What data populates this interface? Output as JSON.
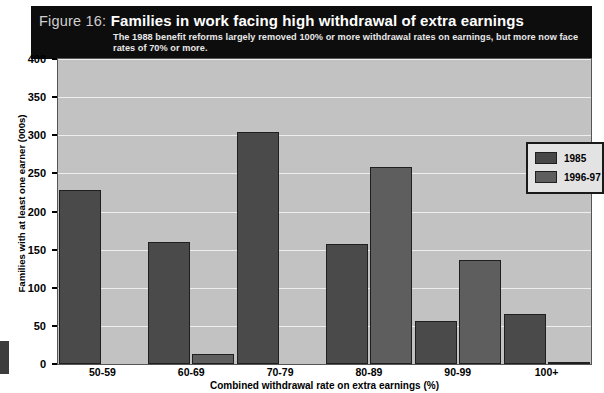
{
  "figure": {
    "number_label": "Figure 16:",
    "title": "Families in work facing high withdrawal of extra earnings",
    "subtitle": "The 1988 benefit reforms largely removed 100% or more withdrawal rates on earnings, but more now face rates of 70% or more."
  },
  "colors": {
    "title_band": "#0d0d0d",
    "plot_background": "#c2c2c2",
    "gridline": "#eeeeee",
    "series_1985": "#4a4a4a",
    "series_1996_97": "#5e5e5e",
    "bar_outline": "#1f1f1f",
    "legend_background": "#e3e3e3"
  },
  "chart_data": {
    "type": "bar",
    "title": "Families in work facing high withdrawal of extra earnings",
    "subtitle": "The 1988 benefit reforms largely removed 100% or more withdrawal rates on earnings, but more now face rates of 70% or more.",
    "xlabel": "Combined withdrawal rate on extra earnings (%)",
    "ylabel": "Families with at least one earner (000s)",
    "categories": [
      "50-59",
      "60-69",
      "70-79",
      "80-89",
      "90-99",
      "100+"
    ],
    "series": [
      {
        "name": "1985",
        "values": [
          228,
          160,
          304,
          158,
          57,
          66
        ]
      },
      {
        "name": "1996-97",
        "values": [
          0,
          13,
          0,
          258,
          136,
          3
        ]
      }
    ],
    "ylim": [
      0,
      400
    ],
    "yticks": [
      0,
      50,
      100,
      150,
      200,
      250,
      300,
      350,
      400
    ],
    "ytick_labels": [
      "0",
      "50",
      "100",
      "150",
      "200",
      "250",
      "300",
      "350",
      "400"
    ],
    "grid": true,
    "legend_position": "upper right",
    "legend_entries": [
      "1985",
      "1996-97"
    ]
  }
}
